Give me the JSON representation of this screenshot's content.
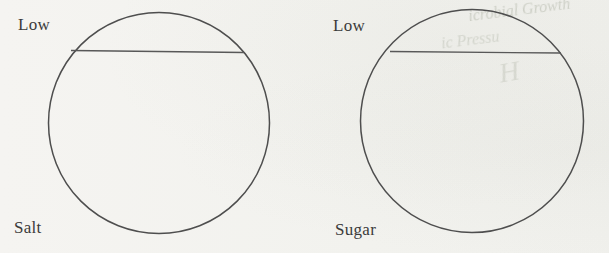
{
  "diagram": {
    "left_flask": {
      "level_label": "Low",
      "solute_label": "Salt"
    },
    "right_flask": {
      "level_label": "Low",
      "solute_label": "Sugar"
    }
  },
  "ghost_text": {
    "line1": "icrobial Growth",
    "line2": "ic Pressu",
    "line3": "H"
  },
  "colors": {
    "paper": "#f3f2ef",
    "stroke": "#4e4e4e",
    "label_text": "#3b3b3b"
  }
}
